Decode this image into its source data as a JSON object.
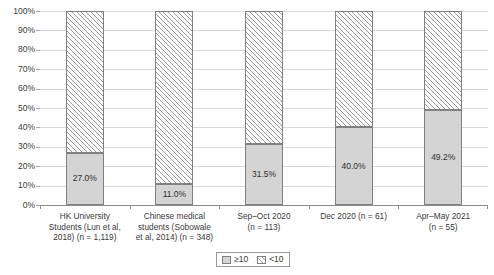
{
  "chart_data": {
    "type": "bar",
    "subtype": "100% stacked bar",
    "title": "",
    "xlabel": "",
    "ylabel": "",
    "ylim": [
      0,
      100
    ],
    "y_tick_labels": [
      "100%",
      "90%",
      "80%",
      "70%",
      "60%",
      "50%",
      "40%",
      "30%",
      "20%",
      "10%",
      "0%"
    ],
    "y_tick_values": [
      100,
      90,
      80,
      70,
      60,
      50,
      40,
      30,
      20,
      10,
      0
    ],
    "grid": true,
    "grid_axis": "y",
    "legend_position": "bottom",
    "categories": [
      "HK University Students (Lun et al, 2018) (n = 1,119)",
      "Chinese medical students (Sobowale et al, 2014) (n = 348)",
      "Sep–Oct 2020 (n = 113)",
      "Dec 2020 (n = 61)",
      "Apr–May 2021 (n = 55)"
    ],
    "category_lines": [
      [
        "HK University",
        "Students (Lun et al,",
        "2018) (n = 1,119)"
      ],
      [
        "Chinese medical",
        "students (Sobowale",
        "et al, 2014) (n = 348)"
      ],
      [
        "Sep–Oct 2020",
        "(n = 113)"
      ],
      [
        "Dec 2020 (n = 61)"
      ],
      [
        "Apr–May 2021",
        "(n = 55)"
      ]
    ],
    "series": [
      {
        "name": "≥10",
        "fill": "solid-gray",
        "color": "#d4d4d4",
        "values": [
          27.0,
          11.0,
          31.5,
          40.0,
          49.2
        ],
        "data_labels": [
          "27.0%",
          "11.0%",
          "31.5%",
          "40.0%",
          "49.2%"
        ]
      },
      {
        "name": "<10",
        "fill": "diagonal-hatch",
        "color": "#ffffff",
        "values": [
          73.0,
          89.0,
          68.5,
          60.0,
          50.8
        ],
        "data_labels": [
          "",
          "",
          "",
          "",
          ""
        ]
      }
    ]
  },
  "legend": {
    "items": [
      {
        "label": "≥10",
        "swatch": "solid-gray-swatch"
      },
      {
        "label": "<10",
        "swatch": "hatched-swatch"
      }
    ]
  },
  "colors": {
    "solid_segment": "#d4d4d4",
    "hatch_line": "#9a9a9a",
    "segment_border": "#808080",
    "gridline": "#d9d9d9",
    "axis_line": "#8c8c8c",
    "text": "#3a3a3a",
    "background": "#ffffff"
  }
}
